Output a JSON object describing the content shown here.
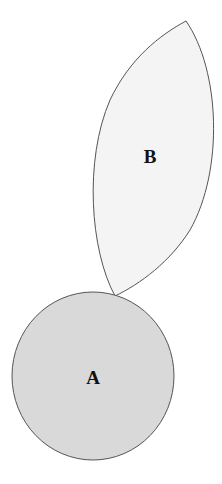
{
  "diagram": {
    "shapes": [
      {
        "id": "A",
        "type": "circle",
        "label": "A",
        "fill": "#d9d9d9",
        "stroke": "#555555"
      },
      {
        "id": "B",
        "type": "leaf",
        "label": "B",
        "fill": "#f4f4f4",
        "stroke": "#555555"
      }
    ]
  }
}
